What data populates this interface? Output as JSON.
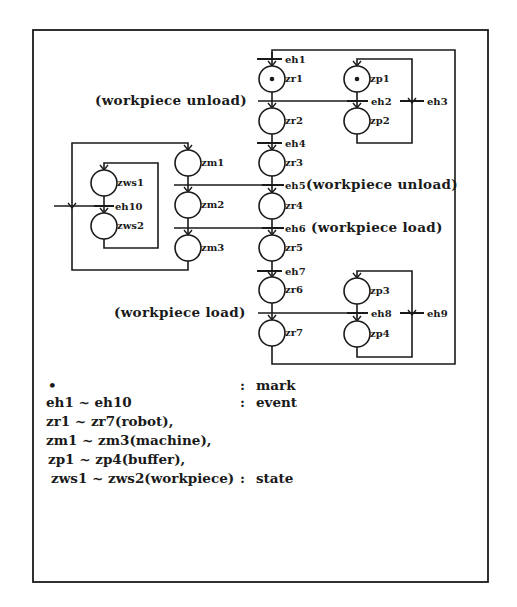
{
  "diagram": {
    "type": "petri-net",
    "frame": {
      "x": 33,
      "y": 30,
      "w": 455,
      "h": 552
    },
    "places": [
      {
        "id": "zr1",
        "label": "zr1",
        "cx": 272,
        "cy": 79,
        "marked": true
      },
      {
        "id": "zr2",
        "label": "zr2",
        "cx": 272,
        "cy": 121,
        "marked": false
      },
      {
        "id": "zr3",
        "label": "zr3",
        "cx": 272,
        "cy": 163,
        "marked": false
      },
      {
        "id": "zr4",
        "label": "zr4",
        "cx": 272,
        "cy": 206,
        "marked": false
      },
      {
        "id": "zr5",
        "label": "zr5",
        "cx": 272,
        "cy": 248,
        "marked": false
      },
      {
        "id": "zr6",
        "label": "zr6",
        "cx": 272,
        "cy": 290,
        "marked": false
      },
      {
        "id": "zr7",
        "label": "zr7",
        "cx": 272,
        "cy": 333,
        "marked": false
      },
      {
        "id": "zp1",
        "label": "zp1",
        "cx": 357,
        "cy": 79,
        "marked": true
      },
      {
        "id": "zp2",
        "label": "zp2",
        "cx": 357,
        "cy": 121,
        "marked": false
      },
      {
        "id": "zp3",
        "label": "zp3",
        "cx": 357,
        "cy": 291,
        "marked": false
      },
      {
        "id": "zp4",
        "label": "zp4",
        "cx": 357,
        "cy": 334,
        "marked": false
      },
      {
        "id": "zm1",
        "label": "zm1",
        "cx": 188,
        "cy": 163,
        "marked": false
      },
      {
        "id": "zm2",
        "label": "zm2",
        "cx": 188,
        "cy": 205,
        "marked": false
      },
      {
        "id": "zm3",
        "label": "zm3",
        "cx": 188,
        "cy": 248,
        "marked": false
      },
      {
        "id": "zws1",
        "label": "zws1",
        "cx": 104,
        "cy": 183,
        "marked": false
      },
      {
        "id": "zws2",
        "label": "zws2",
        "cx": 104,
        "cy": 226,
        "marked": false
      }
    ],
    "transitions": [
      {
        "id": "eh1",
        "label": "eh1",
        "x": 272,
        "y": 59
      },
      {
        "id": "eh2",
        "label": "eh2",
        "x": 357,
        "y": 101
      },
      {
        "id": "eh3",
        "label": "eh3",
        "x": 412,
        "y": 101
      },
      {
        "id": "eh4",
        "label": "eh4",
        "x": 272,
        "y": 143
      },
      {
        "id": "eh5",
        "label": "eh5",
        "x": 272,
        "y": 185
      },
      {
        "id": "eh6",
        "label": "eh6",
        "x": 272,
        "y": 228
      },
      {
        "id": "eh7",
        "label": "eh7",
        "x": 272,
        "y": 271
      },
      {
        "id": "eh8",
        "label": "eh8",
        "x": 357,
        "y": 313
      },
      {
        "id": "eh9",
        "label": "eh9",
        "x": 412,
        "y": 313
      },
      {
        "id": "eh10",
        "label": "eh10",
        "x": 104,
        "y": 206
      }
    ],
    "annotations": [
      {
        "id": "ann-eh2",
        "text": "(workpiece unload)",
        "x": 95,
        "y": 105,
        "anchor": "start"
      },
      {
        "id": "ann-eh5",
        "text": "(workpiece unload)",
        "x": 306,
        "y": 189,
        "anchor": "start"
      },
      {
        "id": "ann-eh6",
        "text": "(workpiece load)",
        "x": 311,
        "y": 232,
        "anchor": "start"
      },
      {
        "id": "ann-eh8",
        "text": "(workpiece load)",
        "x": 114,
        "y": 317,
        "anchor": "start"
      }
    ]
  },
  "legend": {
    "rows": [
      {
        "term": "•",
        "sep": ":",
        "desc": "mark"
      },
      {
        "term": "eh1 ~ eh10",
        "sep": ":",
        "desc": "event"
      },
      {
        "term": "zr1 ~ zr7(robot),",
        "sep": "",
        "desc": ""
      },
      {
        "term": "zm1 ~ zm3(machine),",
        "sep": "",
        "desc": ""
      },
      {
        "term": "zp1 ~ zp4(buffer),",
        "sep": "",
        "desc": ""
      },
      {
        "term": "zws1 ~ zws2(workpiece)",
        "sep": ":",
        "desc": "state"
      }
    ]
  },
  "colors": {
    "ink": "#1a1a1a",
    "paper": "#ffffff"
  }
}
